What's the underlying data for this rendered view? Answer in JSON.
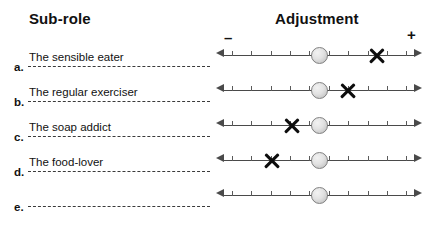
{
  "headings": {
    "left": "Sub-role",
    "right": "Adjustment"
  },
  "scale_signs": {
    "negative": "–",
    "positive": "+"
  },
  "scale": {
    "tick_count": 10,
    "knob_position_percent": 50,
    "knob_icon": "scale-knob-circle",
    "marker_icon": "x-mark-icon",
    "left_arrow_icon": "arrow-left-icon",
    "right_arrow_icon": "arrow-right-icon"
  },
  "rows": [
    {
      "letter": "a.",
      "label": "The sensible eater",
      "marker_percent": 80,
      "has_marker": true
    },
    {
      "letter": "b.",
      "label": "The regular exerciser",
      "marker_percent": 65,
      "has_marker": true
    },
    {
      "letter": "c.",
      "label": "The soap addict",
      "marker_percent": 36,
      "has_marker": true
    },
    {
      "letter": "d.",
      "label": "The food-lover",
      "marker_percent": 26,
      "has_marker": true
    },
    {
      "letter": "e.",
      "label": "",
      "marker_percent": 50,
      "has_marker": false
    }
  ],
  "chart_data": {
    "type": "scatter",
    "title": "Adjustment",
    "xlabel": "Adjustment",
    "ylabel": "Sub-role",
    "xlim": [
      -5,
      5
    ],
    "grid": false,
    "categories": [
      "The sensible eater",
      "The regular exerciser",
      "The soap addict",
      "The food-lover",
      ""
    ],
    "series": [
      {
        "name": "Neutral reference (knob)",
        "values": [
          0,
          0,
          0,
          0,
          0
        ]
      },
      {
        "name": "Marked adjustment (X)",
        "values": [
          3,
          1.5,
          -1.4,
          -2.4,
          null
        ]
      }
    ]
  }
}
